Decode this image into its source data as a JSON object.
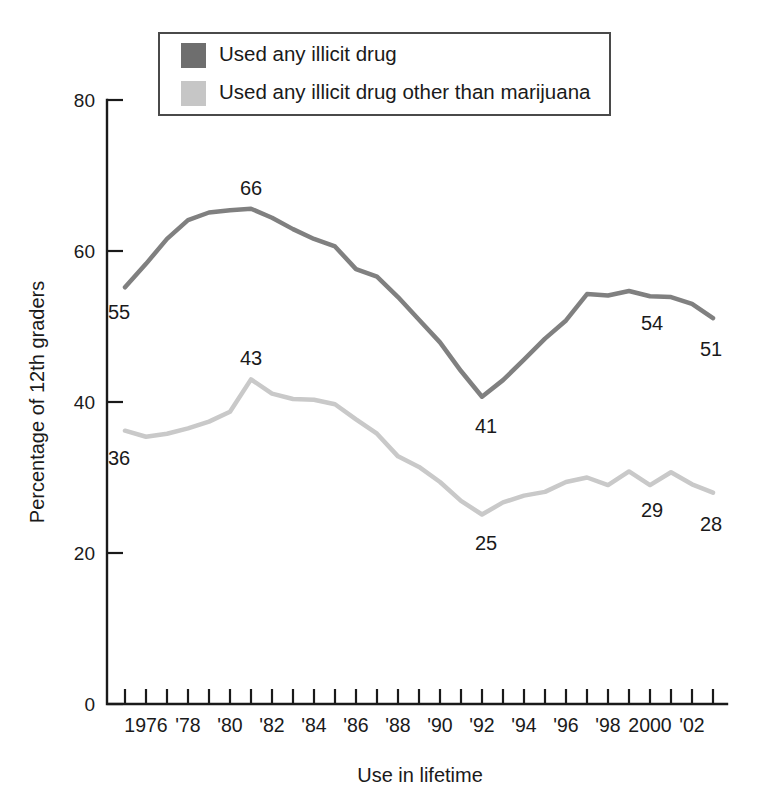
{
  "chart_data": {
    "type": "line",
    "title": "",
    "xlabel": "Use in lifetime",
    "ylabel": "Percentage of 12th graders",
    "ylim": [
      0,
      80
    ],
    "yticks": [
      0,
      20,
      40,
      60,
      80
    ],
    "ytick_labels": [
      "0",
      "20",
      "40",
      "60",
      "80"
    ],
    "xlim": [
      1975,
      2003
    ],
    "x": [
      1975,
      1976,
      1977,
      1978,
      1979,
      1980,
      1981,
      1982,
      1983,
      1984,
      1985,
      1986,
      1987,
      1988,
      1989,
      1990,
      1991,
      1992,
      1993,
      1994,
      1995,
      1996,
      1997,
      1998,
      1999,
      2000,
      2001,
      2002,
      2003
    ],
    "xtick_years": [
      1975,
      1976,
      1977,
      1978,
      1979,
      1980,
      1981,
      1982,
      1983,
      1984,
      1985,
      1986,
      1987,
      1988,
      1989,
      1990,
      1991,
      1992,
      1993,
      1994,
      1995,
      1996,
      1997,
      1998,
      1999,
      2000,
      2001,
      2002,
      2003
    ],
    "xtick_labels": [
      {
        "year": 1976,
        "text": "1976"
      },
      {
        "year": 1978,
        "text": "'78"
      },
      {
        "year": 1980,
        "text": "'80"
      },
      {
        "year": 1982,
        "text": "'82"
      },
      {
        "year": 1984,
        "text": "'84"
      },
      {
        "year": 1986,
        "text": "'86"
      },
      {
        "year": 1988,
        "text": "'88"
      },
      {
        "year": 1990,
        "text": "'90"
      },
      {
        "year": 1992,
        "text": "'92"
      },
      {
        "year": 1994,
        "text": "'94"
      },
      {
        "year": 1996,
        "text": "'96"
      },
      {
        "year": 1998,
        "text": "'98"
      },
      {
        "year": 2000,
        "text": "2000"
      },
      {
        "year": 2002,
        "text": "'02"
      }
    ],
    "grid": false,
    "legend_position": "top-center",
    "series": [
      {
        "name": "Used any illicit drug",
        "color": "#808080",
        "swatch_color": "#6e6e6e",
        "line_width": 4.5,
        "values": [
          55.2,
          58.3,
          61.6,
          64.1,
          65.1,
          65.4,
          65.6,
          64.4,
          62.9,
          61.6,
          60.6,
          57.6,
          56.6,
          53.9,
          50.9,
          47.9,
          44.1,
          40.7,
          42.9,
          45.6,
          48.4,
          50.8,
          54.3,
          54.1,
          54.7,
          54.0,
          53.9,
          53.0,
          51.1
        ],
        "labeled_points": [
          {
            "year": 1975,
            "value": 55.2,
            "text": "55",
            "dx": -6,
            "dy": 32
          },
          {
            "year": 1981,
            "value": 65.6,
            "text": "66",
            "dx": 0,
            "dy": -14
          },
          {
            "year": 1992,
            "value": 40.7,
            "text": "41",
            "dx": 4,
            "dy": 36
          },
          {
            "year": 2000,
            "value": 54.0,
            "text": "54",
            "dx": 2,
            "dy": 34
          },
          {
            "year": 2003,
            "value": 51.1,
            "text": "51",
            "dx": -2,
            "dy": 38
          }
        ]
      },
      {
        "name": "Used any illicit drug other than marijuana",
        "color": "#c9c9c9",
        "swatch_color": "#c6c6c6",
        "line_width": 4.5,
        "values": [
          36.2,
          35.4,
          35.8,
          36.5,
          37.4,
          38.7,
          43.0,
          41.1,
          40.4,
          40.3,
          39.7,
          37.7,
          35.8,
          32.8,
          31.4,
          29.4,
          26.9,
          25.1,
          26.7,
          27.6,
          28.1,
          29.4,
          30.0,
          29.0,
          30.8,
          29.0,
          30.7,
          29.1,
          28.0
        ],
        "labeled_points": [
          {
            "year": 1975,
            "value": 36.2,
            "text": "36",
            "dx": -6,
            "dy": 34
          },
          {
            "year": 1981,
            "value": 43.0,
            "text": "43",
            "dx": 0,
            "dy": -14
          },
          {
            "year": 1992,
            "value": 25.1,
            "text": "25",
            "dx": 4,
            "dy": 36
          },
          {
            "year": 2000,
            "value": 29.0,
            "text": "29",
            "dx": 2,
            "dy": 32
          },
          {
            "year": 2003,
            "value": 28.0,
            "text": "28",
            "dx": -2,
            "dy": 38
          }
        ]
      }
    ]
  },
  "legend": {
    "items": [
      {
        "label": "Used any illicit drug",
        "color": "#6e6e6e"
      },
      {
        "label": "Used any illicit drug other than marijuana",
        "color": "#c6c6c6"
      }
    ]
  },
  "colors": {
    "axis": "#1a1a1a",
    "background": "#ffffff",
    "series_dark": "#808080",
    "series_light": "#c9c9c9"
  }
}
